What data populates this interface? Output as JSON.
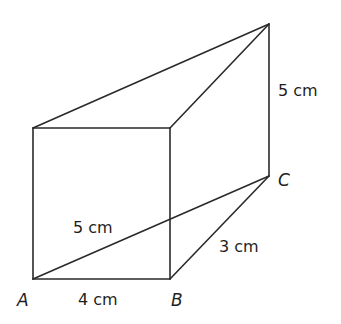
{
  "diagram": {
    "type": "triangular prism (3D solid)",
    "vertices": {
      "A": "A",
      "B": "B",
      "C": "C"
    },
    "labels": {
      "AB": "4 cm",
      "BC": "3 cm",
      "AC": "5 cm",
      "height": "5 cm"
    },
    "colors": {
      "line": "#2a2a2a",
      "text": "#1e1e1e",
      "background": "#ffffff"
    }
  }
}
